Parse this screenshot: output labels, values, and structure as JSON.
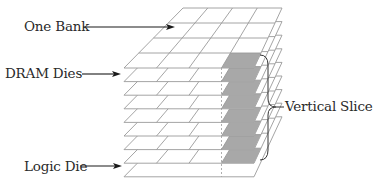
{
  "diagram": {
    "labels": {
      "one_bank": "One Bank",
      "dram_dies": "DRAM Dies",
      "logic_die": "Logic Die",
      "vertical_slice": "Vertical Slice"
    },
    "structure": {
      "dram_die_count": 8,
      "logic_die_count": 1,
      "grid_columns": 4,
      "grid_rows": 4,
      "highlighted_column": 4
    },
    "colors": {
      "line": "#9a9a9a",
      "shade": "#a8a8a8",
      "arrow": "#1a1a1a",
      "text": "#2a2a2a"
    }
  }
}
